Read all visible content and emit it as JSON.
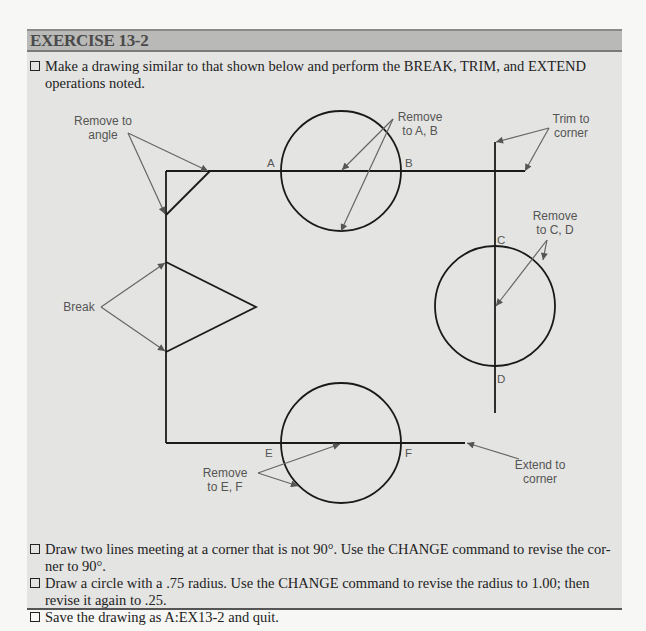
{
  "exercise": {
    "title": "EXERCISE 13-2",
    "intro": {
      "line1": "Make a drawing similar to that shown below and perform the BREAK, TRIM, and EXTEND",
      "line2": "operations noted."
    },
    "figure": {
      "callouts": {
        "remove_to_angle": [
          "Remove to",
          "angle"
        ],
        "remove_to_ab": [
          "Remove",
          "to A, B"
        ],
        "trim_to_corner": [
          "Trim to",
          "corner"
        ],
        "remove_to_cd": [
          "Remove",
          "to C, D"
        ],
        "break": "Break",
        "remove_to_ef": [
          "Remove",
          "to E, F"
        ],
        "extend_to_corner": [
          "Extend to",
          "corner"
        ]
      },
      "points": {
        "a": "A",
        "b": "B",
        "c": "C",
        "d": "D",
        "e": "E",
        "f": "F"
      }
    },
    "tasks": [
      {
        "line1": "Draw two lines meeting at a corner that is not 90°. Use the CHANGE command to revise the cor-",
        "line2": "ner to 90°."
      },
      {
        "line1": "Draw a circle with a .75 radius. Use the CHANGE command to revise the radius to 1.00; then",
        "line2": "revise it again to .25."
      },
      {
        "line1": "Save the drawing as A:EX13-2 and quit.",
        "line2": ""
      }
    ]
  }
}
